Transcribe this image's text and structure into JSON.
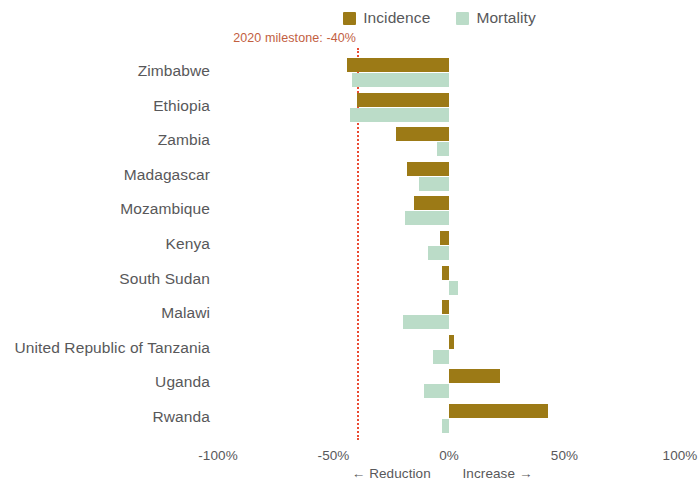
{
  "legend": {
    "entries": [
      {
        "label": "Incidence",
        "color": "#9c7a16",
        "icon": "square-swatch"
      },
      {
        "label": "Mortality",
        "color": "#bbdcc8",
        "icon": "square-swatch"
      }
    ]
  },
  "annotation": {
    "milestone_label": "2020 milestone: -40%",
    "milestone_value": -40,
    "line_color": "#ea4b33",
    "text_color": "#c2603f"
  },
  "axis": {
    "x_ticks": [
      "-100%",
      "-50%",
      "0%",
      "50%",
      "100%"
    ],
    "x_tick_values": [
      -100,
      -50,
      0,
      50,
      100
    ],
    "x_sub_left": "← Reduction",
    "x_sub_right": "Increase →",
    "xlim": [
      -100,
      100
    ]
  },
  "chart_data": {
    "type": "bar",
    "orientation": "horizontal",
    "title": "",
    "subtitle": "",
    "xlabel": "",
    "ylabel": "",
    "xlim": [
      -100,
      100
    ],
    "grid": false,
    "legend_position": "top-right",
    "categories": [
      "Zimbabwe",
      "Ethiopia",
      "Zambia",
      "Madagascar",
      "Mozambique",
      "Kenya",
      "South Sudan",
      "Malawi",
      "United Republic of Tanzania",
      "Uganda",
      "Rwanda"
    ],
    "series": [
      {
        "name": "Incidence",
        "color": "#9c7a16",
        "values": [
          -44,
          -40,
          -23,
          -18,
          -15,
          -4,
          -3,
          -3,
          2,
          22,
          43
        ]
      },
      {
        "name": "Mortality",
        "color": "#bbdcc8",
        "values": [
          -42,
          -43,
          -5,
          -13,
          -19,
          -9,
          4,
          -20,
          -7,
          -11,
          -3
        ]
      }
    ],
    "annotations": [
      {
        "type": "vline",
        "value": -40,
        "label": "2020 milestone: -40%",
        "style": "dotted",
        "color": "#ea4b33"
      }
    ],
    "axis_note": "← Reduction   Increase →"
  }
}
